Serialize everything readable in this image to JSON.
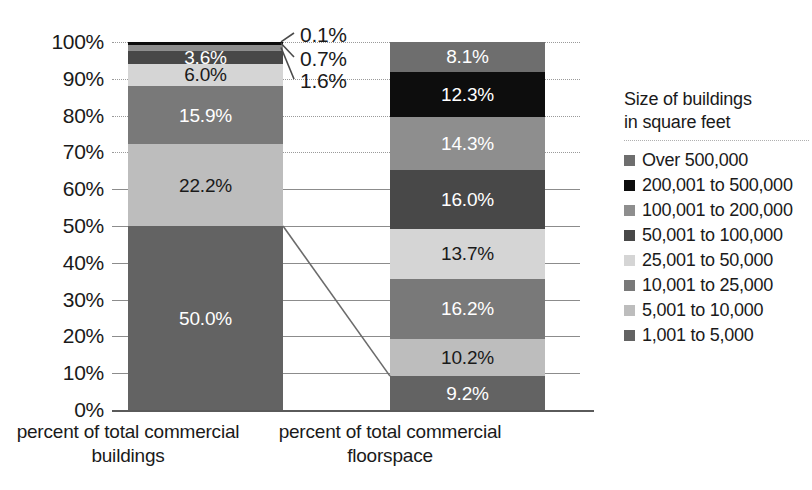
{
  "chart_data": {
    "type": "bar",
    "stacked": true,
    "normalized_percent": true,
    "title": "",
    "xlabel": "",
    "ylabel": "",
    "ylim": [
      0,
      100
    ],
    "grid": true,
    "legend_position": "right",
    "categories": [
      "percent of total commercial buildings",
      "percent of total commercial floorspace"
    ],
    "y_ticks": [
      "0%",
      "10%",
      "20%",
      "30%",
      "40%",
      "50%",
      "60%",
      "70%",
      "80%",
      "90%",
      "100%"
    ],
    "y_tick_values": [
      0,
      10,
      20,
      30,
      40,
      50,
      60,
      70,
      80,
      90,
      100
    ],
    "series": [
      {
        "name": "Over 500,000",
        "color": "#6e6e6e",
        "values": [
          0.1,
          8.1
        ],
        "labels": [
          "0.1%",
          "8.1%"
        ],
        "label_outside": [
          true,
          false
        ]
      },
      {
        "name": "200,001 to 500,000",
        "color": "#0d0d0d",
        "values": [
          0.7,
          12.3
        ],
        "labels": [
          "0.7%",
          "12.3%"
        ],
        "label_outside": [
          true,
          false
        ]
      },
      {
        "name": "100,001 to 200,000",
        "color": "#8e8e8e",
        "values": [
          1.6,
          14.3
        ],
        "labels": [
          "1.6%",
          "14.3%"
        ],
        "label_outside": [
          true,
          false
        ]
      },
      {
        "name": "50,001 to 100,000",
        "color": "#484848",
        "values": [
          3.6,
          16.0
        ],
        "labels": [
          "3.6%",
          "16.0%"
        ],
        "label_outside": [
          false,
          false
        ]
      },
      {
        "name": "25,001 to 50,000",
        "color": "#d5d5d5",
        "values": [
          6.0,
          13.7
        ],
        "labels": [
          "6.0%",
          "13.7%"
        ],
        "label_outside": [
          false,
          false
        ]
      },
      {
        "name": "10,001 to 25,000",
        "color": "#797979",
        "values": [
          15.9,
          16.2
        ],
        "labels": [
          "15.9%",
          "16.2%"
        ],
        "label_outside": [
          false,
          false
        ]
      },
      {
        "name": "5,001 to 10,000",
        "color": "#bdbdbd",
        "values": [
          22.2,
          10.2
        ],
        "labels": [
          "22.2%",
          "10.2%"
        ],
        "label_outside": [
          false,
          false
        ]
      },
      {
        "name": "1,001 to 5,000",
        "color": "#636363",
        "values": [
          50.0,
          9.2
        ],
        "labels": [
          "50.0%",
          "9.2%"
        ],
        "label_outside": [
          false,
          false
        ]
      }
    ],
    "callouts": [
      {
        "label": "0.1%",
        "series": "Over 500,000",
        "bar": 0
      },
      {
        "label": "0.7%",
        "series": "200,001 to 500,000",
        "bar": 0
      },
      {
        "label": "1.6%",
        "series": "100,001 to 200,000",
        "bar": 0
      }
    ],
    "connector": {
      "from_bar": 0,
      "from_value": 50.0,
      "to_bar": 1,
      "to_value": 9.2,
      "color": "#6b6b6b"
    }
  },
  "legend": {
    "title": "Size of buildings\nin square feet"
  }
}
